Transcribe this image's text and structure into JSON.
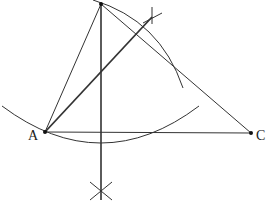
{
  "diagram": {
    "points": {
      "A": {
        "label": "A",
        "x": 45,
        "y": 132
      },
      "B": {
        "label": "",
        "x": 101,
        "y": 4
      },
      "C": {
        "label": "C",
        "x": 251,
        "y": 133
      },
      "foot_mark": {
        "x": 101,
        "y": 192
      },
      "bisector_mark": {
        "x": 152,
        "y": 16
      }
    },
    "caption_partial": "(cut off text at bottom edge)"
  }
}
